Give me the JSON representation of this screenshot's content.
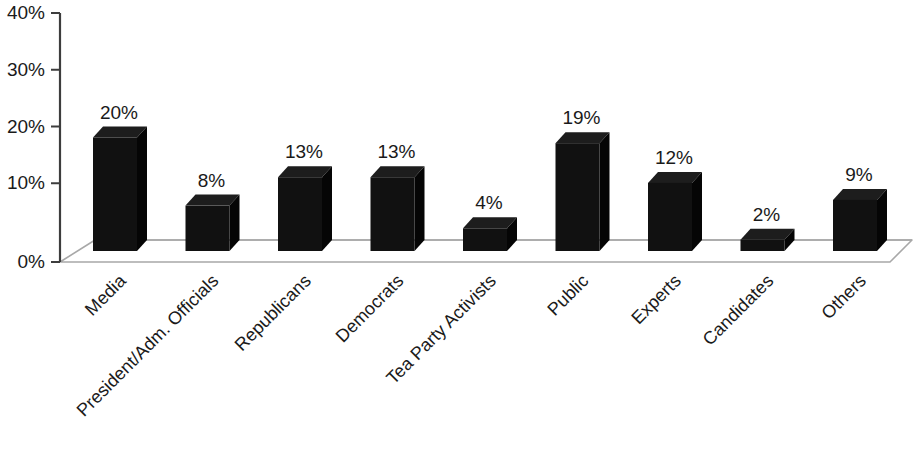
{
  "chart_data": {
    "type": "bar",
    "title": "",
    "subtitle": "",
    "xlabel": "",
    "ylabel": "",
    "ylim": [
      0,
      40
    ],
    "y_tick_labels": [
      "0%",
      "10%",
      "20%",
      "30%",
      "40%"
    ],
    "y_ticks": [
      0,
      10,
      20,
      30,
      40
    ],
    "grid": false,
    "legend": false,
    "legend_position": "none",
    "value_suffix": "%",
    "style": "3d-column",
    "bar_color": "#111111",
    "categories": [
      "Media",
      "President/Adm. Officials",
      "Republicans",
      "Democrats",
      "Tea Party Activists",
      "Public",
      "Experts",
      "Candidates",
      "Others"
    ],
    "values": [
      20,
      8,
      13,
      13,
      4,
      19,
      12,
      2,
      9
    ],
    "data_labels": [
      "20%",
      "8%",
      "13%",
      "13%",
      "4%",
      "19%",
      "12%",
      "2%",
      "9%"
    ]
  }
}
